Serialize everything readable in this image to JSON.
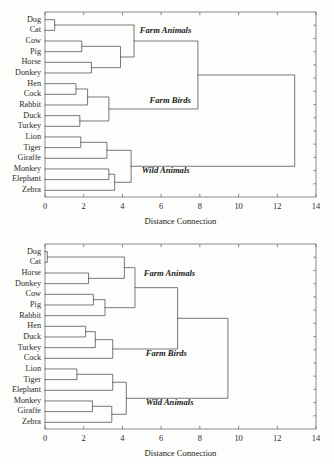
{
  "page": {
    "background": "#fdfdfc",
    "line_color": "#555555",
    "frame_color": "#6e6e6e",
    "text_color": "#2b2b2b"
  },
  "chart_data": [
    {
      "id": "dendrogram-top",
      "type": "dendrogram",
      "title": "",
      "xlabel": "Distance Connection",
      "ylabel": "",
      "xlim": [
        0,
        14
      ],
      "xticks": [
        0,
        2,
        4,
        6,
        8,
        10,
        12,
        14
      ],
      "xticklabels": [
        "0",
        "2",
        "4",
        "6",
        "8",
        "10",
        "12",
        "14"
      ],
      "grid": false,
      "legend": "none",
      "leaves": [
        "Dog",
        "Cat",
        "Cow",
        "Pig",
        "Horse",
        "Donkey",
        "Hen",
        "Cock",
        "Rabbit",
        "Duck",
        "Turkey",
        "Lion",
        "Tiger",
        "Giraffe",
        "Monkey",
        "Elephant",
        "Zebra"
      ],
      "annotations": [
        {
          "text": "Farm Animals",
          "x": 4.9,
          "leaf_index": 1.1
        },
        {
          "text": "Farm Birds",
          "x": 5.4,
          "leaf_index": 7.6
        },
        {
          "text": "Wild Animals",
          "x": 5.0,
          "leaf_index": 14.2
        }
      ],
      "merges": [
        {
          "name": "Dog+Cat",
          "height": 0.5,
          "children": [
            "Dog",
            "Cat"
          ]
        },
        {
          "name": "Cow+Pig",
          "height": 1.9,
          "children": [
            "Cow",
            "Pig"
          ]
        },
        {
          "name": "Horse+Donkey",
          "height": 2.4,
          "children": [
            "Horse",
            "Donkey"
          ]
        },
        {
          "name": "CowPig+HorseDonkey",
          "height": 3.9,
          "children": [
            "Cow+Pig",
            "Horse+Donkey"
          ]
        },
        {
          "name": "FarmAnimals",
          "height": 4.6,
          "children": [
            "Dog+Cat",
            "CowPig+HorseDonkey"
          ]
        },
        {
          "name": "Hen+Cock",
          "height": 1.6,
          "children": [
            "Hen",
            "Cock"
          ]
        },
        {
          "name": "HenCock+Rabbit",
          "height": 2.2,
          "children": [
            "Hen+Cock",
            "Rabbit"
          ]
        },
        {
          "name": "Duck+Turkey",
          "height": 1.8,
          "children": [
            "Duck",
            "Turkey"
          ]
        },
        {
          "name": "FarmBirds",
          "height": 3.3,
          "children": [
            "HenCock+Rabbit",
            "Duck+Turkey"
          ]
        },
        {
          "name": "FarmGroup",
          "height": 7.9,
          "children": [
            "FarmAnimals",
            "FarmBirds"
          ]
        },
        {
          "name": "Lion+Tiger",
          "height": 1.85,
          "children": [
            "Lion",
            "Tiger"
          ]
        },
        {
          "name": "LionTiger+Giraffe",
          "height": 3.2,
          "children": [
            "Lion+Tiger",
            "Giraffe"
          ]
        },
        {
          "name": "Monkey+Elephant",
          "height": 3.3,
          "children": [
            "Monkey",
            "Elephant"
          ]
        },
        {
          "name": "MonkeyElephant+Zebra",
          "height": 3.6,
          "children": [
            "Monkey+Elephant",
            "Zebra"
          ]
        },
        {
          "name": "WildAnimals",
          "height": 4.45,
          "children": [
            "LionTiger+Giraffe",
            "MonkeyElephant+Zebra"
          ]
        },
        {
          "name": "Root",
          "height": 12.9,
          "children": [
            "FarmGroup",
            "WildAnimals"
          ]
        }
      ]
    },
    {
      "id": "dendrogram-bottom",
      "type": "dendrogram",
      "title": "",
      "xlabel": "Distance Connection",
      "ylabel": "",
      "xlim": [
        0,
        14
      ],
      "xticks": [
        0,
        2,
        4,
        6,
        8,
        10,
        12,
        14
      ],
      "xticklabels": [
        "0",
        "2",
        "4",
        "6",
        "8",
        "10",
        "12",
        "14"
      ],
      "grid": false,
      "legend": "none",
      "leaves": [
        "Dog",
        "Cat",
        "Horse",
        "Donkey",
        "Cow",
        "Pig",
        "Rabbit",
        "Hen",
        "Duck",
        "Turkey",
        "Cock",
        "Lion",
        "Tiger",
        "Elephant",
        "Monkey",
        "Giraffe",
        "Zebra"
      ],
      "annotations": [
        {
          "text": "Farm Animals",
          "x": 5.1,
          "leaf_index": 2.1
        },
        {
          "text": "Farm Birds",
          "x": 5.2,
          "leaf_index": 9.6
        },
        {
          "text": "Wild Animals",
          "x": 5.2,
          "leaf_index": 14.2
        }
      ],
      "merges": [
        {
          "name": "Dog+Cat",
          "height": 0.12,
          "children": [
            "Dog",
            "Cat"
          ]
        },
        {
          "name": "Horse+Donkey",
          "height": 2.25,
          "children": [
            "Horse",
            "Donkey"
          ]
        },
        {
          "name": "DogCat+HorseDonkey",
          "height": 4.1,
          "children": [
            "Dog+Cat",
            "Horse+Donkey"
          ]
        },
        {
          "name": "Cow+Pig",
          "height": 2.5,
          "children": [
            "Cow",
            "Pig"
          ]
        },
        {
          "name": "CowPig+Rabbit",
          "height": 3.1,
          "children": [
            "Cow+Pig",
            "Rabbit"
          ]
        },
        {
          "name": "FarmAnimals",
          "height": 4.65,
          "children": [
            "DogCat+HorseDonkey",
            "CowPig+Rabbit"
          ]
        },
        {
          "name": "Hen+Duck",
          "height": 2.1,
          "children": [
            "Hen",
            "Duck"
          ]
        },
        {
          "name": "HenDuck+Turkey",
          "height": 2.6,
          "children": [
            "Hen+Duck",
            "Turkey"
          ]
        },
        {
          "name": "FarmBirds",
          "height": 3.5,
          "children": [
            "HenDuck+Turkey",
            "Cock"
          ]
        },
        {
          "name": "FarmGroup",
          "height": 6.85,
          "children": [
            "FarmAnimals",
            "FarmBirds"
          ]
        },
        {
          "name": "Lion+Tiger",
          "height": 1.65,
          "children": [
            "Lion",
            "Tiger"
          ]
        },
        {
          "name": "LionTiger+Elephant",
          "height": 3.5,
          "children": [
            "Lion+Tiger",
            "Elephant"
          ]
        },
        {
          "name": "Monkey+Giraffe",
          "height": 2.45,
          "children": [
            "Monkey",
            "Giraffe"
          ]
        },
        {
          "name": "MonkeyGiraffe+Zebra",
          "height": 3.45,
          "children": [
            "Monkey+Giraffe",
            "Zebra"
          ]
        },
        {
          "name": "WildAnimals",
          "height": 4.2,
          "children": [
            "LionTiger+Elephant",
            "MonkeyGiraffe+Zebra"
          ]
        },
        {
          "name": "Root",
          "height": 9.45,
          "children": [
            "FarmGroup",
            "WildAnimals"
          ]
        }
      ]
    }
  ]
}
